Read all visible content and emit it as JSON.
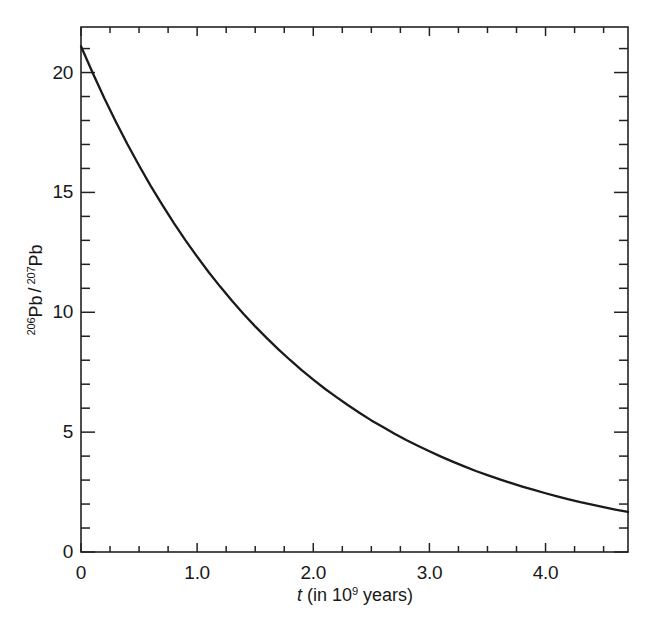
{
  "figure": {
    "background_color": "#ffffff",
    "line_color": "#1a1a1a",
    "axis_color": "#222222"
  },
  "axes": {
    "x_title_prefix": "t",
    "x_title_rest_before": "(in 10",
    "x_title_exponent": "9",
    "x_title_rest_after": " years)",
    "y_title_sup1": "206",
    "y_title_base1": "Pb",
    "y_title_separator": "/",
    "y_title_sup2": "207",
    "y_title_base2": "Pb",
    "x_tick_labels": [
      "0",
      "1.0",
      "2.0",
      "3.0",
      "4.0"
    ],
    "y_tick_labels": [
      "0",
      "5",
      "10",
      "15",
      "20"
    ]
  },
  "chart_data": {
    "type": "line",
    "title": "",
    "xlabel": "t (in 10^9 years)",
    "ylabel": "206Pb / 207Pb",
    "xlim": [
      0,
      4.71
    ],
    "ylim": [
      0,
      21.9
    ],
    "grid": false,
    "legend": "none",
    "x_major_ticks": [
      0,
      1.0,
      2.0,
      3.0,
      4.0
    ],
    "y_major_ticks": [
      0,
      5,
      10,
      15,
      20
    ],
    "x_minor_tick_interval": 0.25,
    "y_minor_tick_interval": 1,
    "series": [
      {
        "name": "206Pb/207Pb ratio",
        "x": [
          0.0,
          0.1,
          0.2,
          0.3,
          0.4,
          0.5,
          0.6,
          0.7,
          0.8,
          0.9,
          1.0,
          1.1,
          1.2,
          1.3,
          1.4,
          1.5,
          1.6,
          1.7,
          1.8,
          1.9,
          2.0,
          2.1,
          2.2,
          2.3,
          2.4,
          2.5,
          2.6,
          2.7,
          2.8,
          2.9,
          3.0,
          3.1,
          3.2,
          3.3,
          3.4,
          3.5,
          3.6,
          3.7,
          3.8,
          3.9,
          4.0,
          4.1,
          4.2,
          4.3,
          4.4,
          4.5,
          4.6,
          4.71
        ],
        "y": [
          21.1,
          19.99,
          18.94,
          17.95,
          17.01,
          16.12,
          15.27,
          14.48,
          13.72,
          13.0,
          12.32,
          11.67,
          11.06,
          10.48,
          9.93,
          9.41,
          8.92,
          8.45,
          8.01,
          7.59,
          7.19,
          6.81,
          6.46,
          6.12,
          5.8,
          5.49,
          5.21,
          4.93,
          4.67,
          4.43,
          4.2,
          3.98,
          3.77,
          3.57,
          3.38,
          3.21,
          3.04,
          2.88,
          2.73,
          2.59,
          2.45,
          2.32,
          2.2,
          2.08,
          1.98,
          1.87,
          1.77,
          1.67
        ]
      }
    ]
  }
}
